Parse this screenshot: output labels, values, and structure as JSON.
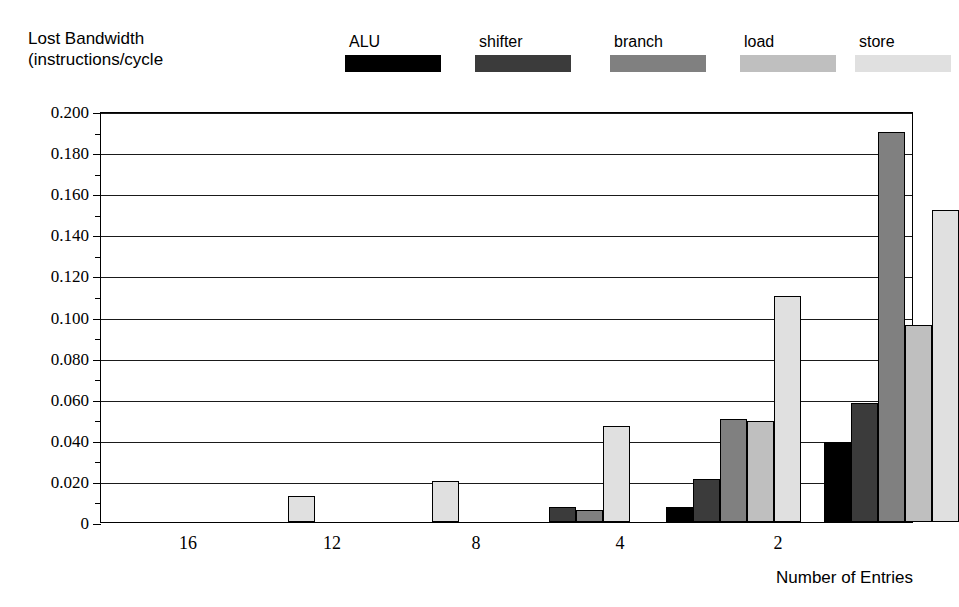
{
  "chart_data": {
    "type": "bar",
    "title": "",
    "ylabel": "Lost Bandwidth\n(instructions/cycle",
    "ylabel_line1": "Lost Bandwidth",
    "ylabel_line2": "(instructions/cycle",
    "xlabel": "Number of Entries",
    "categories": [
      "16",
      "12",
      "8",
      "4",
      "2"
    ],
    "ylim": [
      0,
      0.2
    ],
    "ytick_values": [
      0,
      0.02,
      0.04,
      0.06,
      0.08,
      0.1,
      0.12,
      0.14,
      0.16,
      0.18,
      0.2
    ],
    "ytick_labels": [
      "0",
      "0.020",
      "0.040",
      "0.060",
      "0.080",
      "0.100",
      "0.120",
      "0.140",
      "0.160",
      "0.180",
      "0.200"
    ],
    "yminor_values": [
      0.01,
      0.03,
      0.05,
      0.07,
      0.09,
      0.11,
      0.13,
      0.15,
      0.17,
      0.19
    ],
    "grid": true,
    "legend_position": "top",
    "series": [
      {
        "name": "ALU",
        "color": "#000000",
        "values": [
          0,
          0,
          0,
          0.0075,
          0.039
        ]
      },
      {
        "name": "shifter",
        "color": "#3b3b3b",
        "values": [
          0,
          0,
          0.0075,
          0.021,
          0.058
        ]
      },
      {
        "name": "branch",
        "color": "#808080",
        "values": [
          0,
          0,
          0.006,
          0.05,
          0.19
        ]
      },
      {
        "name": "load",
        "color": "#bfbfbf",
        "values": [
          0,
          0,
          0,
          0.049,
          0.096
        ]
      },
      {
        "name": "store",
        "color": "#e0e0e0",
        "values": [
          0.0125,
          0.02,
          0.0465,
          0.11,
          0.152
        ]
      }
    ]
  }
}
